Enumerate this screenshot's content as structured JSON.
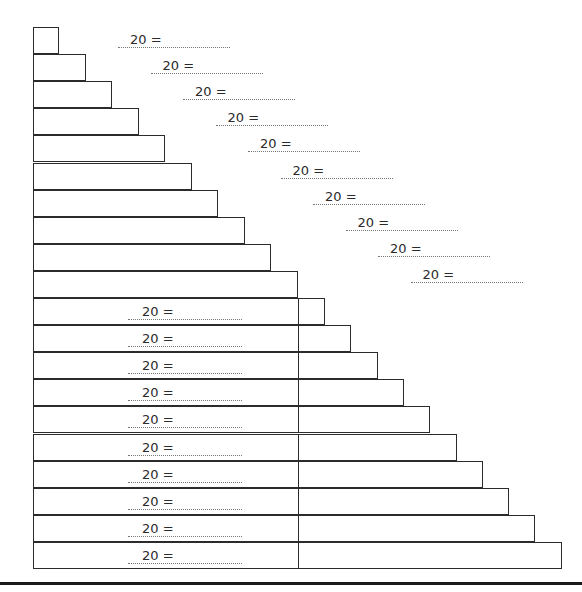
{
  "worksheet": {
    "staircase_rows": 20,
    "top_labels": [
      "20 =",
      "20 =",
      "20 =",
      "20 =",
      "20 =",
      "20 =",
      "20 =",
      "20 =",
      "20 =",
      "20 ="
    ],
    "bottom_labels": [
      "20 =",
      "20 =",
      "20 =",
      "20 =",
      "20 =",
      "20 =",
      "20 =",
      "20 =",
      "20 =",
      "20 ="
    ]
  }
}
